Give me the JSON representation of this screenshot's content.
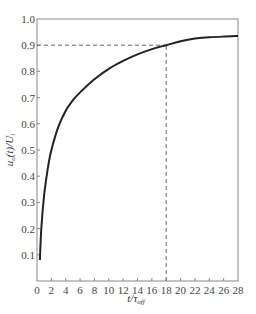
{
  "chart_data": {
    "type": "line",
    "title": "",
    "xlabel": "t/τ_off",
    "ylabel": "u_o(t)/U_i",
    "xlim": [
      0,
      28
    ],
    "ylim": [
      0,
      1.0
    ],
    "grid": false,
    "legend": null,
    "x_ticks": [
      "0",
      "2",
      "4",
      "6",
      "8",
      "10",
      "12",
      "14",
      "16",
      "18",
      "20",
      "22",
      "24",
      "26",
      "28"
    ],
    "y_ticks": [
      "0.1",
      "0.2",
      "0.3",
      "0.4",
      "0.5",
      "0.6",
      "0.7",
      "0.8",
      "0.9",
      "1.0"
    ],
    "series": [
      {
        "name": "u_o(t)/U_i",
        "x": [
          0.4,
          0.6,
          1,
          1.5,
          2,
          3,
          4,
          5,
          6,
          8,
          10,
          12,
          14,
          16,
          18,
          20,
          22,
          24,
          26,
          28
        ],
        "values": [
          0.08,
          0.2,
          0.33,
          0.43,
          0.5,
          0.59,
          0.65,
          0.69,
          0.72,
          0.77,
          0.81,
          0.84,
          0.865,
          0.885,
          0.9,
          0.915,
          0.925,
          0.93,
          0.933,
          0.935
        ]
      }
    ],
    "annotations": [
      {
        "type": "hline-dashed",
        "y": 0.9,
        "x_from": 0,
        "x_to": 18
      },
      {
        "type": "vline-dashed",
        "x": 18,
        "y_from": 0,
        "y_to": 0.9
      }
    ]
  },
  "labels": {
    "x_axis": "t/τ",
    "x_axis_sub": "off",
    "y_axis_main": "u",
    "y_axis_sub": "o",
    "y_axis_rest": "(t)/U",
    "y_axis_sub2": "i"
  }
}
